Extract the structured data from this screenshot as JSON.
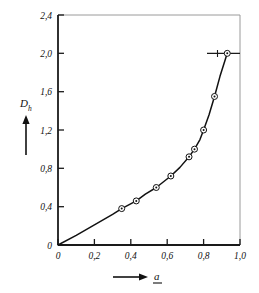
{
  "chart_data": {
    "type": "line",
    "title": "",
    "subtitle": "",
    "xlabel": "a",
    "ylabel": "D",
    "ylabel_sub": "h",
    "xlim": [
      0,
      1.0
    ],
    "ylim": [
      0,
      2.4
    ],
    "grid": false,
    "legend": null,
    "x_ticks": [
      0,
      0.2,
      0.4,
      0.6,
      0.8,
      1.0
    ],
    "x_tick_labels": [
      "0",
      "0,2",
      "0,4",
      "0,6",
      "0,8",
      "1,0"
    ],
    "y_ticks": [
      0,
      0.4,
      0.8,
      1.2,
      1.6,
      2.0,
      2.4
    ],
    "y_tick_labels": [
      "0",
      "0,4",
      "0,8",
      "1,2",
      "1,6",
      "2,0",
      "2,4"
    ],
    "x": [
      0.35,
      0.43,
      0.54,
      0.62,
      0.72,
      0.75,
      0.8,
      0.86,
      0.93
    ],
    "values": [
      0.38,
      0.46,
      0.6,
      0.72,
      0.92,
      1.0,
      1.2,
      1.55,
      2.0
    ],
    "curve": [
      [
        0.0,
        0.0
      ],
      [
        0.1,
        0.1
      ],
      [
        0.2,
        0.21
      ],
      [
        0.3,
        0.32
      ],
      [
        0.35,
        0.38
      ],
      [
        0.43,
        0.46
      ],
      [
        0.48,
        0.53
      ],
      [
        0.54,
        0.6
      ],
      [
        0.58,
        0.66
      ],
      [
        0.62,
        0.72
      ],
      [
        0.67,
        0.81
      ],
      [
        0.72,
        0.92
      ],
      [
        0.75,
        1.0
      ],
      [
        0.78,
        1.1
      ],
      [
        0.8,
        1.2
      ],
      [
        0.83,
        1.36
      ],
      [
        0.86,
        1.55
      ],
      [
        0.89,
        1.76
      ],
      [
        0.93,
        2.0
      ]
    ],
    "annotation_line": {
      "y": 2.0,
      "x_start": 0.93,
      "x_end": 1.0,
      "tick_x": 0.875
    },
    "marker_style": "circle-with-center-dot",
    "colors": {
      "curve": "#111111",
      "marker": "#111111",
      "frame": "#555555",
      "axis": "#111111",
      "background": "#ffffff"
    }
  }
}
